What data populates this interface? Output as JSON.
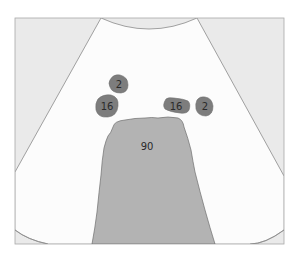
{
  "diagram": {
    "type": "ultrasound-sector-schematic",
    "colors": {
      "background": "#ffffff",
      "frame_fill": "#eaeaea",
      "frame_border": "#a8a8a8",
      "sector_fill": "#fcfcfc",
      "sector_stroke": "#8a8a8a",
      "large_region_fill": "#b3b3b3",
      "small_region_fill": "#7d7d7d",
      "region_stroke": "#6e6e6e",
      "label_color": "#2a2a2a"
    },
    "regions": [
      {
        "id": "region-2-left",
        "label": "2"
      },
      {
        "id": "region-16-left",
        "label": "16"
      },
      {
        "id": "region-16-right",
        "label": "16"
      },
      {
        "id": "region-2-right",
        "label": "2"
      },
      {
        "id": "region-90-center",
        "label": "90"
      }
    ]
  }
}
